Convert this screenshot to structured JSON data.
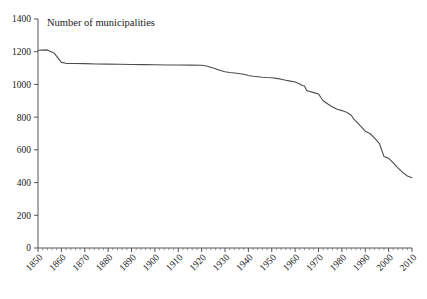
{
  "chart_data": {
    "type": "line",
    "title": "Number of municipalities",
    "xlabel": "",
    "ylabel": "",
    "xlim": [
      1850,
      2010
    ],
    "ylim": [
      0,
      1400
    ],
    "grid": false,
    "legend": "none",
    "y_ticks": [
      0,
      200,
      400,
      600,
      800,
      1000,
      1200,
      1400
    ],
    "y_tick_labels": [
      "0",
      "200",
      "400",
      "600",
      "800",
      "1000",
      "1200",
      "1400"
    ],
    "x_ticks": [
      1850,
      1860,
      1870,
      1880,
      1890,
      1900,
      1910,
      1920,
      1930,
      1940,
      1950,
      1960,
      1970,
      1980,
      1990,
      2000,
      2010
    ],
    "x_tick_labels": [
      "1850",
      "1860",
      "1870",
      "1880",
      "1890",
      "1900",
      "1910",
      "1920",
      "1930",
      "1940",
      "1950",
      "1960",
      "1970",
      "1980",
      "1990",
      "2000",
      "2010"
    ],
    "x_minor_tick_interval": 2,
    "x_tick_label_rotation": -45,
    "series": [
      {
        "name": "Number of municipalities",
        "color": "#4d4d4d",
        "x": [
          1850,
          1854,
          1857,
          1860,
          1862,
          1866,
          1870,
          1875,
          1880,
          1885,
          1890,
          1895,
          1900,
          1905,
          1910,
          1915,
          1920,
          1922,
          1925,
          1928,
          1930,
          1932,
          1935,
          1938,
          1940,
          1942,
          1944,
          1946,
          1948,
          1950,
          1952,
          1954,
          1956,
          1958,
          1960,
          1962,
          1963,
          1964,
          1965,
          1966,
          1968,
          1970,
          1971,
          1972,
          1974,
          1976,
          1978,
          1980,
          1982,
          1984,
          1985,
          1986,
          1988,
          1990,
          1992,
          1994,
          1996,
          1998,
          2000,
          2002,
          2004,
          2006,
          2008,
          2010
        ],
        "y": [
          1209,
          1211,
          1190,
          1135,
          1129,
          1128,
          1127,
          1125,
          1124,
          1123,
          1122,
          1121,
          1120,
          1119,
          1119,
          1118,
          1117,
          1113,
          1100,
          1085,
          1078,
          1073,
          1068,
          1062,
          1055,
          1050,
          1047,
          1044,
          1042,
          1041,
          1037,
          1032,
          1026,
          1020,
          1015,
          1002,
          994,
          990,
          962,
          958,
          950,
          942,
          920,
          900,
          880,
          862,
          848,
          840,
          830,
          812,
          790,
          775,
          745,
          714,
          700,
          672,
          640,
          560,
          548,
          520,
          490,
          462,
          440,
          430
        ]
      }
    ]
  }
}
